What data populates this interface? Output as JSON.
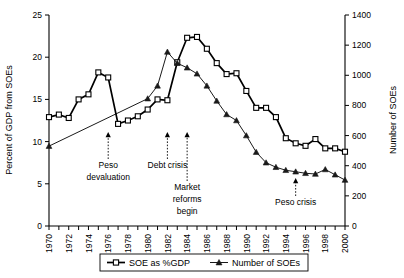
{
  "chart_data": {
    "type": "line",
    "title": "",
    "xlabel": "",
    "ylabel": "Percent of GDP from SOEs",
    "y2label": "Number of SOEs",
    "ylim": [
      0,
      25
    ],
    "y2lim": [
      0,
      1400
    ],
    "xlim": [
      1970,
      2000
    ],
    "grid": false,
    "legend_position": "bottom",
    "yticks": [
      0,
      5,
      10,
      15,
      20,
      25
    ],
    "y2ticks": [
      0,
      200,
      400,
      600,
      800,
      1000,
      1200,
      1400
    ],
    "xticks": [
      1970,
      1972,
      1974,
      1976,
      1978,
      1980,
      1982,
      1984,
      1986,
      1988,
      1990,
      1992,
      1994,
      1996,
      1998,
      2000
    ],
    "xticklabels": [
      "1970",
      "1972",
      "1974",
      "1976",
      "1978",
      "1980",
      "1982",
      "1984",
      "1986",
      "1988",
      "1990",
      "1992",
      "1994",
      "1996",
      "1998",
      "2000"
    ],
    "x": [
      1970,
      1971,
      1972,
      1973,
      1974,
      1975,
      1976,
      1977,
      1978,
      1979,
      1980,
      1981,
      1982,
      1983,
      1984,
      1985,
      1986,
      1987,
      1988,
      1989,
      1990,
      1991,
      1992,
      1993,
      1994,
      1995,
      1996,
      1997,
      1998,
      1999,
      2000
    ],
    "series": [
      {
        "name": "SOE as %GDP",
        "axis": "left",
        "marker": "open-square",
        "values": [
          12.9,
          13.2,
          12.8,
          15.0,
          15.6,
          18.2,
          17.6,
          12.1,
          12.5,
          13.0,
          13.8,
          15.0,
          14.9,
          19.4,
          22.3,
          22.4,
          21.0,
          19.3,
          18.0,
          18.1,
          16.0,
          14.0,
          14.0,
          12.9,
          10.4,
          9.8,
          9.5,
          10.3,
          9.2,
          9.2,
          8.8
        ]
      },
      {
        "name": "Number of SOEs",
        "axis": "right",
        "marker": "filled-triangle",
        "values": [
          530,
          null,
          null,
          null,
          null,
          null,
          null,
          null,
          null,
          null,
          845,
          930,
          1155,
          1080,
          1050,
          1010,
          930,
          830,
          740,
          700,
          600,
          490,
          420,
          390,
          370,
          360,
          350,
          345,
          375,
          340,
          305
        ]
      }
    ],
    "annotations": [
      {
        "label": "Peso\ndevaluation",
        "line1": "Peso",
        "line2": "devaluation",
        "x_year": 1976,
        "arrow_to_y_px": 133
      },
      {
        "label": "Debt crisis",
        "line1": "Debt crisis",
        "line2": "",
        "x_year": 1982,
        "arrow_to_y_px": 133
      },
      {
        "label": "Market\nreforms\nbegin",
        "line1": "Market",
        "line2": "reforms",
        "line3": "begin",
        "x_year": 1984,
        "arrow_to_y_px": 133
      },
      {
        "label": "Peso crisis",
        "line1": "Peso crisis",
        "line2": "",
        "x_year": 1995,
        "arrow_to_y_px": 180
      }
    ]
  },
  "legend": {
    "items": [
      {
        "label": "SOE as %GDP",
        "marker": "open-square"
      },
      {
        "label": "Number of SOEs",
        "marker": "filled-triangle"
      }
    ]
  }
}
